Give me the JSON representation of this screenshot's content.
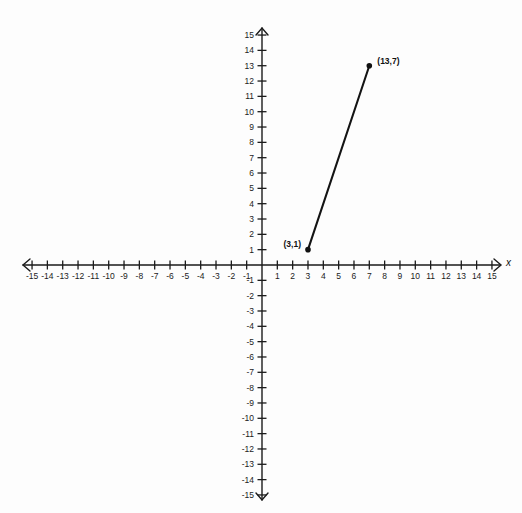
{
  "figure": {
    "background_color": "#fdfdfd",
    "ink_color": "#1b1b1b",
    "x_axis_name": "x",
    "origin_px": {
      "x": 262,
      "y": 265
    },
    "unit_px": 15.33
  },
  "chart_data": {
    "type": "scatter",
    "title": "",
    "xlabel": "x",
    "ylabel": "",
    "xlim": [
      -15,
      15
    ],
    "ylim": [
      -15,
      15
    ],
    "grid": false,
    "legend": "none",
    "x_ticks": [
      -15,
      -14,
      -13,
      -12,
      -11,
      -10,
      -9,
      -8,
      -7,
      -6,
      -5,
      -4,
      -3,
      -2,
      -1,
      1,
      2,
      3,
      4,
      5,
      6,
      7,
      8,
      9,
      10,
      11,
      12,
      13,
      14,
      15
    ],
    "y_ticks": [
      15,
      14,
      13,
      12,
      11,
      10,
      9,
      8,
      7,
      6,
      5,
      4,
      3,
      2,
      1,
      -1,
      -2,
      -3,
      -4,
      -5,
      -6,
      -7,
      -8,
      -9,
      -10,
      -11,
      -12,
      -13,
      -14,
      -15
    ],
    "x_tick_labels": [
      "-15",
      "-14",
      "-13",
      "-12",
      "-11",
      "-10",
      "-9",
      "-8",
      "-7",
      "-6",
      "-5",
      "-4",
      "-3",
      "-2",
      "-1",
      "1",
      "2",
      "3",
      "4",
      "5",
      "6",
      "7",
      "8",
      "9",
      "10",
      "11",
      "12",
      "13",
      "14",
      "15"
    ],
    "y_tick_labels": [
      "15",
      "14",
      "13",
      "12",
      "11",
      "10",
      "9",
      "8",
      "7",
      "6",
      "5",
      "4",
      "3",
      "2",
      "1",
      "-1",
      "-2",
      "-3",
      "-4",
      "-5",
      "-6",
      "-7",
      "-8",
      "-9",
      "-10",
      "-11",
      "-12",
      "-13",
      "-14",
      "-15"
    ],
    "points": [
      {
        "plot_x": 3,
        "plot_y": 1,
        "label": "(3,1)",
        "label_position": "left"
      },
      {
        "plot_x": 7,
        "plot_y": 13,
        "label": "(13,7)",
        "label_position": "upper-right"
      }
    ],
    "series": [
      {
        "name": "segment",
        "type": "line",
        "x": [
          3,
          7
        ],
        "y": [
          1,
          13
        ]
      }
    ],
    "annotations": [
      "(3,1)",
      "(13,7)"
    ]
  }
}
